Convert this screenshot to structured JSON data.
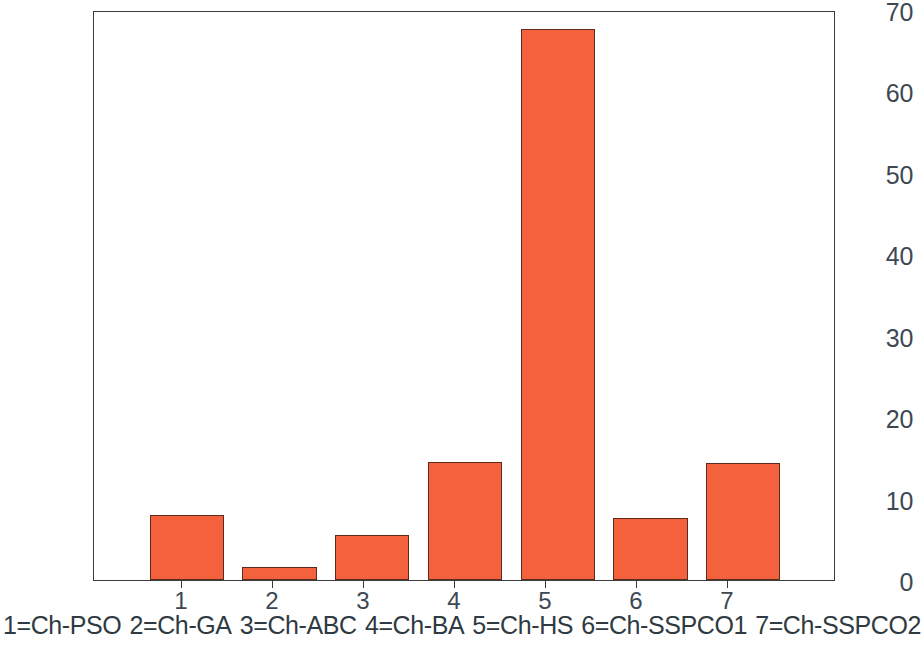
{
  "chart_data": {
    "type": "bar",
    "title": "",
    "xlabel": "",
    "ylabel": "",
    "categories": [
      "1",
      "2",
      "3",
      "4",
      "5",
      "6",
      "7"
    ],
    "values": [
      8.0,
      1.6,
      5.5,
      14.5,
      67.7,
      7.6,
      14.4
    ],
    "ylim": [
      0,
      70
    ],
    "y_ticks": [
      0,
      10,
      20,
      30,
      40,
      50,
      60,
      70
    ],
    "x_tick_labels": [
      "1",
      "2",
      "3",
      "4",
      "5",
      "6",
      "7"
    ],
    "grid": false,
    "legend_position": "below-axis",
    "bar_fill_color": "#f4613d",
    "bar_edge_color": "#5c2b1c",
    "axis_color": "#3c3c3c",
    "tick_label_color": "#3d4852",
    "series": [
      {
        "name": "Ch",
        "values": [
          8.0,
          1.6,
          5.5,
          14.5,
          67.7,
          7.6,
          14.4
        ]
      }
    ],
    "category_legend": [
      "1=Ch-PSO",
      "2=Ch-GA",
      "3=Ch-ABC",
      "4=Ch-BA",
      "5=Ch-HS",
      "6=Ch-SSPCO1",
      "7=Ch-SSPCO2"
    ]
  }
}
